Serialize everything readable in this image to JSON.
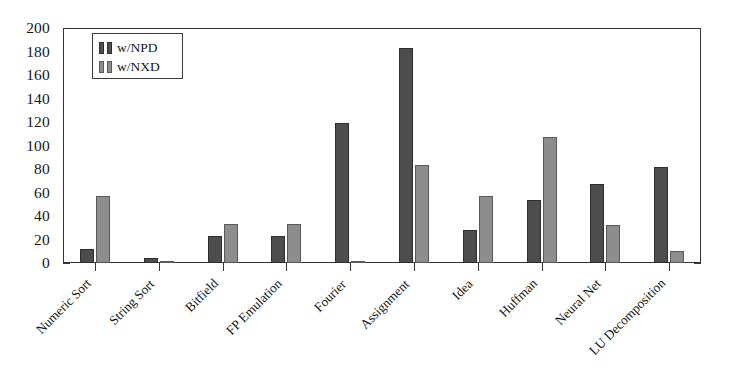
{
  "chart_data": {
    "type": "bar",
    "title": "",
    "subtitle": "",
    "xlabel": "",
    "ylabel": "",
    "ylim": [
      0,
      200
    ],
    "yticks": [
      0,
      20,
      40,
      60,
      80,
      100,
      120,
      140,
      160,
      180,
      200
    ],
    "grid": false,
    "legend_position": "top-left",
    "categories": [
      "Numeric Sort",
      "String Sort",
      "Bitfield",
      "FP Emulation",
      "Fourier",
      "Assignment",
      "Idea",
      "Huffman",
      "Neural Net",
      "LU Decomposition"
    ],
    "series": [
      {
        "name": "w/NPD",
        "color": "#4d4d4d",
        "values": [
          12,
          4,
          23,
          23,
          119,
          183,
          28,
          54,
          67,
          82
        ]
      },
      {
        "name": "w/NXD",
        "color": "#8d8d8d",
        "values": [
          57,
          2,
          33,
          33,
          2,
          83,
          57,
          107,
          32,
          10
        ]
      }
    ]
  },
  "legend": {
    "entries": [
      {
        "label": "w/NPD"
      },
      {
        "label": "w/NXD"
      }
    ]
  },
  "axis": {
    "y_tick_labels": [
      "200",
      "180",
      "160",
      "140",
      "120",
      "100",
      "80",
      "60",
      "40",
      "20",
      "0"
    ]
  },
  "colors": {
    "series_npd": "#4d4d4d",
    "series_nxd": "#8d8d8d",
    "axis": "#333333",
    "background": "#ffffff"
  }
}
